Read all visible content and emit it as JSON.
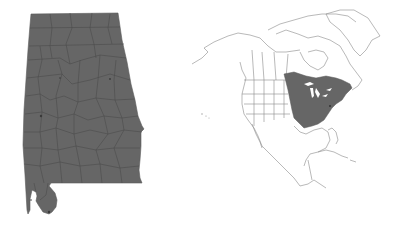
{
  "figure": {
    "panels": [
      {
        "id": "state-map",
        "region": "Alabama",
        "description": "County-level map, all counties shaded",
        "fill_color": "#666666",
        "border_color": "#4a4a4a"
      },
      {
        "id": "range-map",
        "region": "North America",
        "description": "Range map with shaded eastern North America range",
        "range_fill_color": "#666666",
        "outline_color": "#888888",
        "background_color": "#ffffff"
      }
    ]
  },
  "colors": {
    "shaded": "#666666",
    "county_lines": "#4e4e4e",
    "land_outline": "#8a8a8a",
    "background": "#ffffff"
  }
}
